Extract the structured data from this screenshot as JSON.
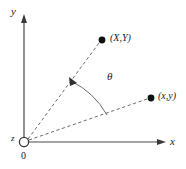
{
  "figure": {
    "type": "diagram",
    "background_color": "#ffffff",
    "stroke_color": "#4a4a4a",
    "text_color": "#1a1a1a",
    "axes": {
      "y_axis_label": "y",
      "x_axis_label": "x",
      "z_axis_label": "z",
      "origin_label": "0"
    },
    "points": [
      {
        "id": "upper-point",
        "label": "(X,Y)",
        "cx": 102,
        "cy": 40
      },
      {
        "id": "lower-point",
        "label": "(x,y)",
        "cx": 151,
        "cy": 98
      }
    ],
    "angle": {
      "symbol": "θ",
      "between": [
        "(X,Y)",
        "(x,y)"
      ]
    },
    "origin": {
      "cx": 24,
      "cy": 142,
      "r": 4.6
    },
    "line_style": "dashed"
  }
}
